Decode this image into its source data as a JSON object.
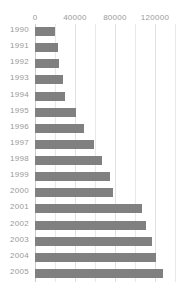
{
  "chart_data": {
    "type": "bar",
    "orientation": "horizontal",
    "title": "",
    "subtitle": "",
    "xlabel": "",
    "ylabel": "",
    "categories": [
      "1990",
      "1991",
      "1992",
      "1993",
      "1994",
      "1995",
      "1996",
      "1997",
      "1998",
      "1999",
      "2000",
      "2001",
      "2002",
      "2003",
      "2004",
      "2005"
    ],
    "values": [
      20000,
      23000,
      24000,
      28000,
      30000,
      41000,
      49000,
      59000,
      67000,
      75000,
      78000,
      107000,
      111000,
      117000,
      121000,
      128000
    ],
    "series": [
      {
        "name": "",
        "values": [
          20000,
          23000,
          24000,
          28000,
          30000,
          41000,
          49000,
          59000,
          67000,
          75000,
          78000,
          107000,
          111000,
          117000,
          121000,
          128000
        ]
      }
    ],
    "xlim": [
      0,
      147000
    ],
    "xticks": [
      0,
      40000,
      80000,
      120000
    ],
    "xtick_labels": [
      "0",
      "40000",
      "80000",
      "120000"
    ],
    "minor_gridlines": [
      20000,
      60000,
      100000,
      140000
    ],
    "grid": true,
    "legend": false,
    "legend_position": "none",
    "bar_color": "#808080",
    "grid_color": "#e8e8e8",
    "axis_color": "#c9c9c9",
    "label_color": "#999999",
    "background_color": "#ffffff"
  }
}
